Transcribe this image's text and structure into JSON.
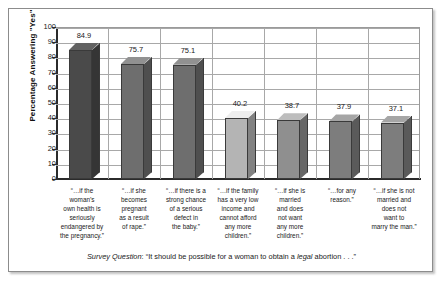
{
  "chart_data": {
    "type": "bar",
    "title": "",
    "subtitle": "",
    "xlabel": "",
    "ylabel": "Percentage Answering \"Yes\"",
    "ylim": [
      0,
      100
    ],
    "ytick_step": 10,
    "yticks": [
      "100",
      "90",
      "80",
      "70",
      "60",
      "50",
      "40",
      "30",
      "20",
      "10",
      "0"
    ],
    "grid": true,
    "grid_orientation": "both",
    "legend": "none",
    "categories": [
      "“…if the woman’s own health is seriously endangered by the pregnancy.”",
      "“…if she becomes pregnant as a result of rape.”",
      "“…if there is a strong chance of a serious defect in the baby.”",
      "“…if the family has a very low income and cannot afford any more children.”",
      "“…if she is married and does not want any more children.”",
      "“…for any reason.”",
      "“…if she is not married and does not want to marry the man.”"
    ],
    "values": [
      84.9,
      75.7,
      75.1,
      40.2,
      38.7,
      37.9,
      37.1
    ],
    "value_labels": [
      "84.9",
      "75.7",
      "75.1",
      "40.2",
      "38.7",
      "37.9",
      "37.1"
    ],
    "bar_colors": [
      "#4a4a4a",
      "#6e6e6e",
      "#6e6e6e",
      "#b4b4b4",
      "#8f8f8f",
      "#7d7d7d",
      "#7d7d7d"
    ],
    "annotation": "Survey Question: “It should be possible for a woman to obtain a legal abortion . . .”"
  },
  "caption": {
    "lead": "Survey Question",
    "colon": ": ",
    "quote_open": "“It should be possible for a woman to obtain a ",
    "emphasis": "legal",
    "quote_close": " abortion . . .”"
  },
  "category_lines": [
    [
      "“…if the",
      "woman’s",
      "own health is",
      "seriously",
      "endangered by",
      "the pregnancy.”"
    ],
    [
      "“…if she",
      "becomes",
      "pregnant",
      "as a result",
      "of rape.”"
    ],
    [
      "“…if there is a",
      "strong chance",
      "of a serious",
      "defect in",
      "the baby.”"
    ],
    [
      "“…if the family",
      "has a very low",
      "income and",
      "cannot afford",
      "any more",
      "children.”"
    ],
    [
      "“…if she is",
      "married",
      "and does",
      "not want",
      "any more",
      "children.”"
    ],
    [
      "“…for any",
      "reason.”"
    ],
    [
      "“…if she is not",
      "married and",
      "does not",
      "want to",
      "marry the man.”"
    ]
  ]
}
